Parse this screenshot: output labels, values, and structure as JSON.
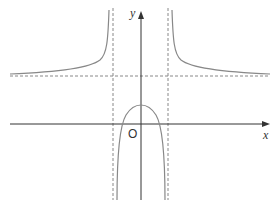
{
  "diagram": {
    "type": "function-graph",
    "x_axis_label": "x",
    "y_axis_label": "y",
    "origin_label": "O",
    "colors": {
      "axis": "#333333",
      "curve": "#888888",
      "asymptote": "#888888",
      "background": "#ffffff"
    },
    "asymptotes": {
      "vertical": [
        "left",
        "right"
      ],
      "horizontal": [
        "above x-axis"
      ]
    }
  }
}
